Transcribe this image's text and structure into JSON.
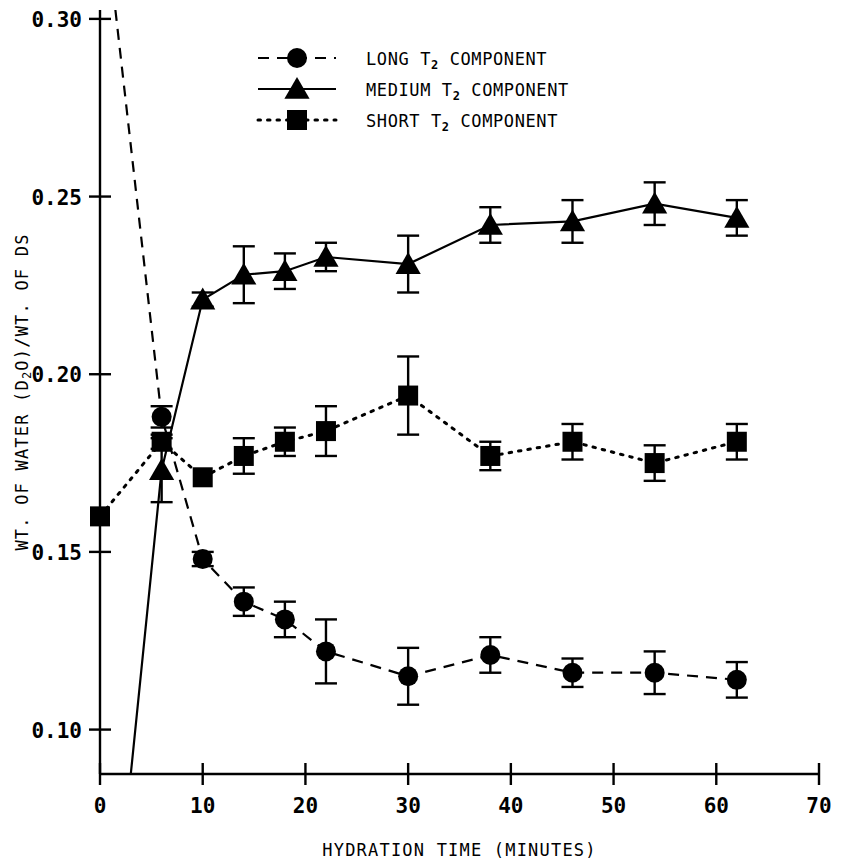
{
  "chart_data": {
    "type": "line",
    "title": "",
    "xlabel": "HYDRATION TIME (MINUTES)",
    "ylabel": "WT. OF WATER (D2O)/WT. OF DS",
    "ylabel_parts": {
      "pre": "WT. OF WATER (D",
      "sub": "2",
      "mid": "O)/WT. OF DS"
    },
    "xlim": [
      0,
      70
    ],
    "ylim": [
      0.0875,
      0.3025
    ],
    "xticks": [
      0,
      10,
      20,
      30,
      40,
      50,
      60,
      70
    ],
    "xtick_labels": [
      "0",
      "10",
      "20",
      "30",
      "40",
      "50",
      "60",
      "70"
    ],
    "yticks": [
      0.1,
      0.15,
      0.2,
      0.25,
      0.3
    ],
    "ytick_labels": [
      "0.10",
      "0.15",
      "0.20",
      "0.25",
      "0.30"
    ],
    "grid": false,
    "legend_position": "top-center",
    "series": [
      {
        "name": "LONG T2 COMPONENT",
        "label_parts": {
          "pre": "LONG ",
          "sub_base": "T",
          "sub": "2",
          "post": " COMPONENT"
        },
        "marker": "circle",
        "linestyle": "dashed",
        "color": "#000000",
        "offscale_entry": {
          "x": 1.5,
          "y": 0.3025
        },
        "x": [
          6,
          10,
          14,
          18,
          22,
          30,
          38,
          46,
          54,
          62
        ],
        "values": [
          0.188,
          0.148,
          0.136,
          0.131,
          0.122,
          0.115,
          0.121,
          0.116,
          0.116,
          0.114
        ],
        "errors": [
          0.003,
          0.002,
          0.004,
          0.005,
          0.009,
          0.008,
          0.005,
          0.004,
          0.006,
          0.005
        ]
      },
      {
        "name": "MEDIUM T2 COMPONENT",
        "label_parts": {
          "pre": "MEDIUM ",
          "sub_base": "T",
          "sub": "2",
          "post": " COMPONENT"
        },
        "marker": "triangle",
        "linestyle": "solid",
        "color": "#000000",
        "offscale_entry": {
          "x": 3.0,
          "y": 0.0875
        },
        "x": [
          6,
          10,
          14,
          18,
          22,
          30,
          38,
          46,
          54,
          62
        ],
        "values": [
          0.173,
          0.221,
          0.228,
          0.229,
          0.233,
          0.231,
          0.242,
          0.243,
          0.248,
          0.244
        ],
        "errors": [
          0.009,
          0.002,
          0.008,
          0.005,
          0.004,
          0.008,
          0.005,
          0.006,
          0.006,
          0.005
        ]
      },
      {
        "name": "SHORT T2 COMPONENT",
        "label_parts": {
          "pre": "SHORT ",
          "sub_base": "T",
          "sub": "2",
          "post": " COMPONENT"
        },
        "marker": "square",
        "linestyle": "dotted",
        "color": "#000000",
        "x": [
          0,
          6,
          10,
          14,
          18,
          22,
          30,
          38,
          46,
          54,
          62
        ],
        "values": [
          0.16,
          0.181,
          0.171,
          0.177,
          0.181,
          0.184,
          0.194,
          0.177,
          0.181,
          0.175,
          0.181
        ],
        "errors": [
          0.0,
          0.002,
          0.0,
          0.005,
          0.004,
          0.007,
          0.011,
          0.004,
          0.005,
          0.005,
          0.005
        ]
      }
    ]
  },
  "legend": {
    "items": [
      {
        "label": "LONG T2 COMPONENT",
        "marker": "circle",
        "linestyle": "dashed"
      },
      {
        "label": "MEDIUM T2 COMPONENT",
        "marker": "triangle",
        "linestyle": "solid"
      },
      {
        "label": "SHORT T2 COMPONENT",
        "marker": "square",
        "linestyle": "dotted"
      }
    ]
  }
}
